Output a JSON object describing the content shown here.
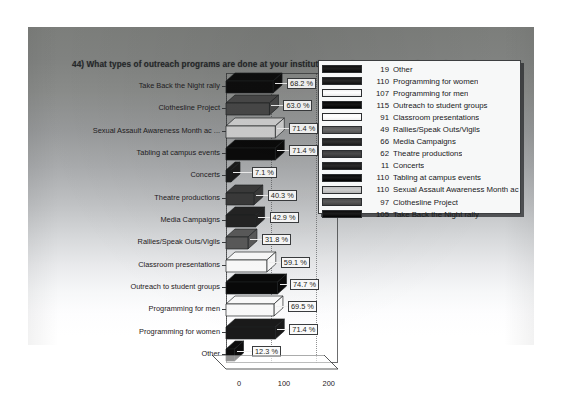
{
  "slide": {
    "title": "44) What types of outreach programs are done at your institution to raise awareness of sexual assault?"
  },
  "chart_data": {
    "type": "bar",
    "orientation": "horizontal",
    "title": "44) What types of outreach programs are done at your institution to raise awareness of sexual assault?",
    "xlabel": "",
    "ylabel": "",
    "xlim": [
      0,
      250
    ],
    "xticks": [
      "0",
      "100",
      "200"
    ],
    "grid": true,
    "legend_position": "right",
    "value_label_suffix": "%",
    "categories": [
      "Take Back the Night rally",
      "Clothesline Project",
      "Sexual Assault Awareness Month ac ...",
      "Tabling at campus events",
      "Concerts",
      "Theatre productions",
      "Media Campaigns",
      "Rallies/Speak Outs/Vigils",
      "Classroom presentations",
      "Outreach to student groups",
      "Programming for men",
      "Programming for women",
      "Other"
    ],
    "counts": [
      105,
      97,
      110,
      110,
      11,
      62,
      66,
      49,
      91,
      115,
      107,
      110,
      19
    ],
    "percent_labels": [
      "68.2 %",
      "63.0 %",
      "71.4 %",
      "71.4 %",
      "7.1 %",
      "40.3 %",
      "42.9 %",
      "31.8 %",
      "59.1 %",
      "74.7 %",
      "69.5 %",
      "71.4 %",
      "12.3 %"
    ],
    "percents": [
      68.2,
      63.0,
      71.4,
      71.4,
      7.1,
      40.3,
      42.9,
      31.8,
      59.1,
      74.7,
      69.5,
      71.4,
      12.3
    ],
    "bar_colors": [
      "#0e0e0e",
      "#4a4a4a",
      "#d2d2d2",
      "#0b0b0b",
      "#1b1b1b",
      "#3b3b3b",
      "#242424",
      "#5a5a5a",
      "#fbfbfb",
      "#090909",
      "#fafafa",
      "#1a1a1a",
      "#0d0d0d"
    ]
  },
  "legend": {
    "items": [
      {
        "count": "19",
        "label": "Other",
        "color": "#111111"
      },
      {
        "count": "110",
        "label": "Programming for women",
        "color": "#1a1a1a"
      },
      {
        "count": "107",
        "label": "Programming for men",
        "color": "#f2f2f2"
      },
      {
        "count": "115",
        "label": "Outreach to student groups",
        "color": "#090909"
      },
      {
        "count": "91",
        "label": "Classroom presentations",
        "color": "#fbfbfb"
      },
      {
        "count": "49",
        "label": "Rallies/Speak Outs/Vigils",
        "color": "#5c5c5c"
      },
      {
        "count": "66",
        "label": "Media Campaigns",
        "color": "#242424"
      },
      {
        "count": "62",
        "label": "Theatre productions",
        "color": "#3c3c3c"
      },
      {
        "count": "11",
        "label": "Concerts",
        "color": "#1c1c1c"
      },
      {
        "count": "110",
        "label": "Tabling at campus events",
        "color": "#0b0b0b"
      },
      {
        "count": "110",
        "label": "Sexual Assault Awareness Month ac",
        "color": "#bfbfbf"
      },
      {
        "count": "97",
        "label": "Clothesline Project",
        "color": "#4c4c4c"
      },
      {
        "count": "105",
        "label": "Take Back the Night rally",
        "color": "#0e0e0e"
      }
    ]
  }
}
